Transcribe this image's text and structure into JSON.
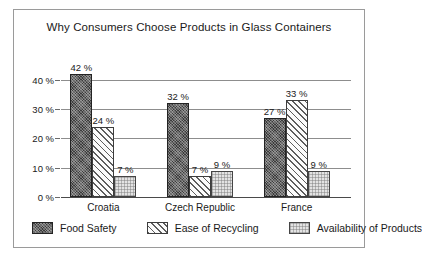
{
  "chart_data": {
    "type": "bar",
    "title": "Why Consumers Choose Products in Glass Containers",
    "xlabel": "",
    "ylabel": "",
    "ylim": [
      0,
      45
    ],
    "grid": true,
    "legend_position": "bottom",
    "value_suffix": " %",
    "categories": [
      "Croatia",
      "Czech Republic",
      "France"
    ],
    "tick_labels": [
      "0 %",
      "10 %",
      "20 %",
      "30 %",
      "40 %"
    ],
    "tick_values": [
      0,
      10,
      20,
      30,
      40
    ],
    "series": [
      {
        "name": "Food Safety",
        "values": [
          42,
          32,
          27
        ],
        "labels": [
          "42 %",
          "32 %",
          "27 %"
        ],
        "color": "#3c3c3c",
        "pattern": "dark-dotted"
      },
      {
        "name": "Ease of Recycling",
        "values": [
          24,
          7,
          33
        ],
        "labels": [
          "24 %",
          "7 %",
          "33 %"
        ],
        "color": "#fbfbfb",
        "pattern": "diagonal-hatch"
      },
      {
        "name": "Availability of Products",
        "values": [
          7,
          9,
          9
        ],
        "labels": [
          "7 %",
          "9 %",
          "9 %"
        ],
        "color": "#e3e3e3",
        "pattern": "light-dotted"
      }
    ]
  }
}
